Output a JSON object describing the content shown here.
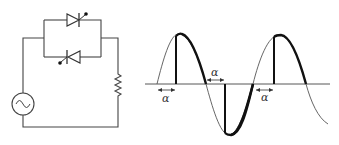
{
  "diagram": {
    "circuit": {
      "source": {
        "icon": "ac-source-icon",
        "symbol": "~"
      },
      "thyristors": [
        {
          "name": "thyristor-forward",
          "direction": "right"
        },
        {
          "name": "thyristor-reverse",
          "direction": "left"
        }
      ],
      "load": {
        "icon": "resistor-icon"
      }
    },
    "waveform": {
      "labels": {
        "alpha_1": "α",
        "alpha_2": "α",
        "alpha_3": "α"
      },
      "colors": {
        "input_wave": "#555555",
        "output_wave": "#111111",
        "axis": "#444444"
      }
    }
  }
}
